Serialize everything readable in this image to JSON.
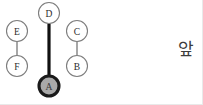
{
  "diagram": {
    "width": 203,
    "height": 105,
    "background_color": "#ffffff",
    "nodes": [
      {
        "id": "D",
        "label": "D",
        "cx": 49,
        "cy": 13,
        "r": 10.5,
        "state": "normal",
        "fill": "#ffffff",
        "stroke": "#7d7d7d"
      },
      {
        "id": "A",
        "label": "A",
        "cx": 49,
        "cy": 86,
        "r": 10.0,
        "state": "highlighted",
        "fill": "#a9a9a9",
        "stroke": "#1a1a1a"
      },
      {
        "id": "E",
        "label": "E",
        "cx": 17,
        "cy": 31,
        "r": 10.5,
        "state": "normal",
        "fill": "#ffffff",
        "stroke": "#7d7d7d"
      },
      {
        "id": "F",
        "label": "F",
        "cx": 17,
        "cy": 66,
        "r": 10.5,
        "state": "normal",
        "fill": "#ffffff",
        "stroke": "#7d7d7d"
      },
      {
        "id": "C",
        "label": "C",
        "cx": 77,
        "cy": 31,
        "r": 10.5,
        "state": "normal",
        "fill": "#ffffff",
        "stroke": "#7d7d7d"
      },
      {
        "id": "B",
        "label": "B",
        "cx": 77,
        "cy": 66,
        "r": 10.5,
        "state": "normal",
        "fill": "#ffffff",
        "stroke": "#7d7d7d"
      }
    ],
    "edges": [
      {
        "id": "D-A",
        "source": "D",
        "target": "A",
        "x1": 49,
        "y1": 23.5,
        "x2": 49,
        "y2": 76.5,
        "weight": "thick",
        "color": "#111111"
      },
      {
        "id": "E-F",
        "source": "E",
        "target": "F",
        "x1": 17,
        "y1": 41.5,
        "x2": 17,
        "y2": 55.5,
        "weight": "thin",
        "color": "#8a8a8a"
      },
      {
        "id": "C-B",
        "source": "C",
        "target": "B",
        "x1": 77,
        "y1": 41.5,
        "x2": 77,
        "y2": 55.5,
        "weight": "thin",
        "color": "#8a8a8a"
      }
    ]
  },
  "caption": {
    "text": "앞"
  }
}
